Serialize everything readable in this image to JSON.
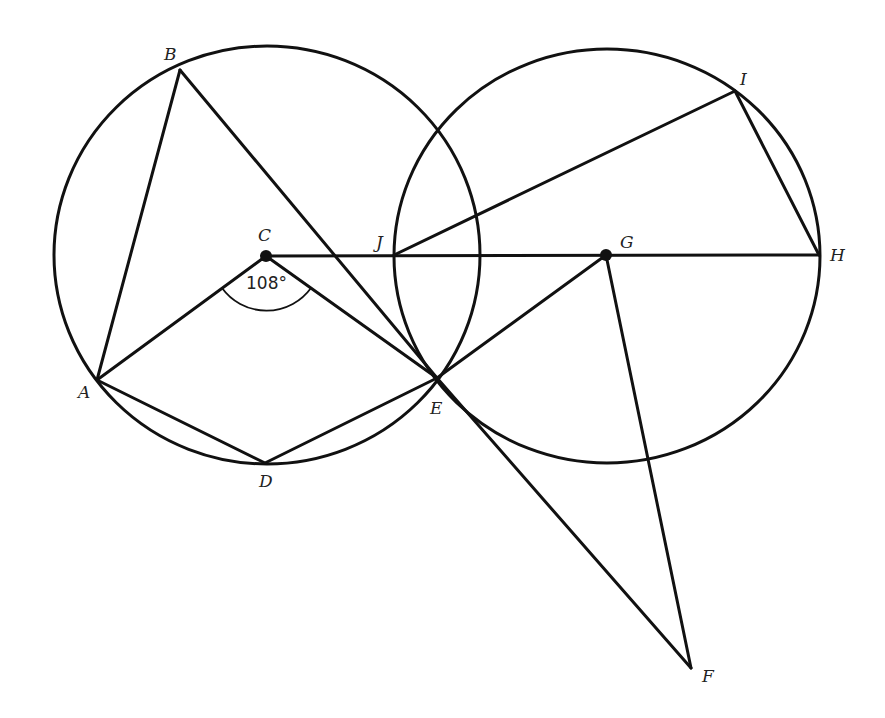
{
  "diagram": {
    "type": "geometry",
    "circles": [
      {
        "name": "circle-C",
        "center": "C",
        "cx": 267,
        "cy": 255,
        "rx": 213,
        "ry": 209
      },
      {
        "name": "circle-G",
        "center": "G",
        "cx": 607,
        "cy": 256,
        "rx": 213,
        "ry": 207
      }
    ],
    "points": {
      "A": {
        "x": 97,
        "y": 380,
        "label": "A",
        "lx": 78,
        "ly": 398
      },
      "B": {
        "x": 180,
        "y": 70,
        "label": "B",
        "lx": 164,
        "ly": 60
      },
      "C": {
        "x": 266,
        "y": 256,
        "label": "C",
        "lx": 258,
        "ly": 242
      },
      "D": {
        "x": 265,
        "y": 463,
        "label": "D",
        "lx": 259,
        "ly": 487
      },
      "E": {
        "x": 437,
        "y": 378,
        "label": "E",
        "lx": 430,
        "ly": 414
      },
      "F": {
        "x": 691,
        "y": 668,
        "label": "F",
        "lx": 702,
        "ly": 682
      },
      "G": {
        "x": 606,
        "y": 255,
        "label": "G",
        "lx": 620,
        "ly": 248
      },
      "H": {
        "x": 819,
        "y": 255,
        "label": "H",
        "lx": 832,
        "ly": 255
      },
      "I": {
        "x": 735,
        "y": 91,
        "label": "I",
        "lx": 740,
        "ly": 85
      },
      "J": {
        "x": 394,
        "y": 255,
        "label": "J",
        "lx": 376,
        "ly": 248
      }
    },
    "segments": [
      [
        "A",
        "B"
      ],
      [
        "B",
        "E"
      ],
      [
        "C",
        "A"
      ],
      [
        "C",
        "E"
      ],
      [
        "A",
        "D"
      ],
      [
        "D",
        "E"
      ],
      [
        "C",
        "H"
      ],
      [
        "J",
        "I"
      ],
      [
        "I",
        "H"
      ],
      [
        "E",
        "G"
      ],
      [
        "G",
        "F"
      ],
      [
        "E",
        "F"
      ]
    ],
    "marked_centers": [
      "C",
      "G"
    ],
    "angle_mark": {
      "vertex": "C",
      "label": "108°",
      "between": [
        "A",
        "E"
      ]
    }
  }
}
